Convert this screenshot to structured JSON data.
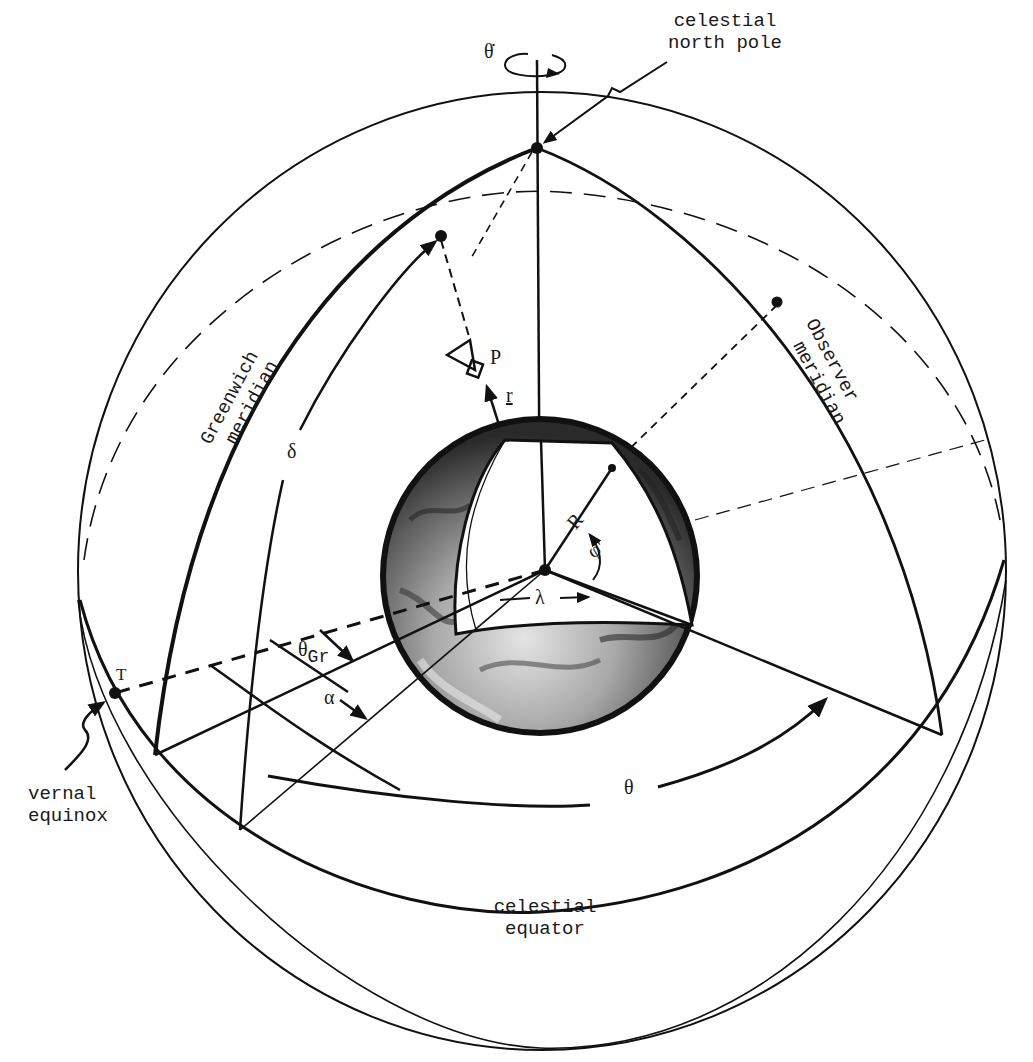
{
  "figure": {
    "colors": {
      "ink": "#111111",
      "background": "#ffffff",
      "earth_dark": "#3a3a3a",
      "earth_light": "#d8d8d8"
    }
  },
  "labels": {
    "theta_dot": "θ̇",
    "celestial_north_pole_line1": "celestial",
    "celestial_north_pole_line2": "north pole",
    "greenwich_line1": "Greenwich",
    "greenwich_line2": "meridian",
    "observer_line1": "Observer",
    "observer_line2": "meridian",
    "delta": "δ",
    "P": "P",
    "r": "r",
    "R": "R",
    "phi_prime": "φ'",
    "lambda": "λ",
    "theta_gr_main": "θ",
    "theta_gr_sub": "Gr",
    "alpha": "α",
    "vernal_symbol": "T",
    "vernal_line1": "vernal",
    "vernal_line2": "equinox",
    "theta": "θ",
    "celestial_equator_line1": "celestial",
    "celestial_equator_line2": "equator"
  }
}
